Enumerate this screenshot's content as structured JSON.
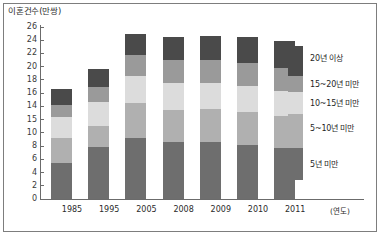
{
  "chart_data": {
    "type": "bar",
    "subtype": "stacked-bar",
    "title": "이혼건수(만쌍)",
    "ylabel": "이혼건수(만쌍)",
    "xlabel": "(연도)",
    "x_unit_note": "(연도)",
    "categories": [
      "1985",
      "1995",
      "2005",
      "2008",
      "2009",
      "2010",
      "2011"
    ],
    "ylim": [
      0,
      26
    ],
    "ytick_labels": [
      "26",
      "24",
      "22",
      "20",
      "18",
      "16",
      "14",
      "15",
      "10",
      "8",
      "6",
      "4",
      "2",
      "0"
    ],
    "ytick_values": [
      26,
      24,
      22,
      20,
      18,
      16,
      14,
      12,
      10,
      8,
      6,
      4,
      2,
      0
    ],
    "grid": false,
    "legend_position": "right",
    "stack_order_bottom_to_top": [
      "5년 미만",
      "5~10년 미만",
      "10~15년 미만",
      "15~20년 미만",
      "20년 이상"
    ],
    "series": [
      {
        "name": "5년 미만",
        "color": "#6e6e6e",
        "values": [
          5.5,
          7.8,
          9.2,
          8.6,
          8.6,
          8.2,
          7.7
        ]
      },
      {
        "name": "5~10년 미만",
        "color": "#b0b0b0",
        "values": [
          3.7,
          3.2,
          5.3,
          4.9,
          5.0,
          5.0,
          4.9
        ]
      },
      {
        "name": "10~15년 미만",
        "color": "#dcdcdc",
        "values": [
          3.2,
          3.7,
          4.1,
          4.1,
          4.0,
          3.9,
          3.8
        ]
      },
      {
        "name": "15~20년 미만",
        "color": "#9a9a9a",
        "values": [
          1.8,
          2.2,
          3.2,
          3.4,
          3.4,
          3.5,
          3.4
        ]
      },
      {
        "name": "20년 이상",
        "color": "#4a4a4a",
        "values": [
          2.5,
          2.7,
          3.2,
          3.5,
          3.6,
          3.9,
          4.1
        ]
      }
    ],
    "totals": [
      16.7,
      19.6,
      25.0,
      24.5,
      24.6,
      24.5,
      23.9
    ]
  },
  "legend": {
    "items": [
      {
        "label": "20년 이상",
        "color": "#4a4a4a"
      },
      {
        "label": "15~20년 미만",
        "color": "#9a9a9a"
      },
      {
        "label": "10~15년 미만",
        "color": "#dcdcdc"
      },
      {
        "label": "5~10년 미만",
        "color": "#b0b0b0"
      },
      {
        "label": "5년 미만",
        "color": "#6e6e6e"
      }
    ]
  },
  "colors": {
    "axis": "#6b6b6b",
    "frame": "#7d7d7d",
    "text": "#2b2b2b",
    "background": "#ffffff"
  }
}
